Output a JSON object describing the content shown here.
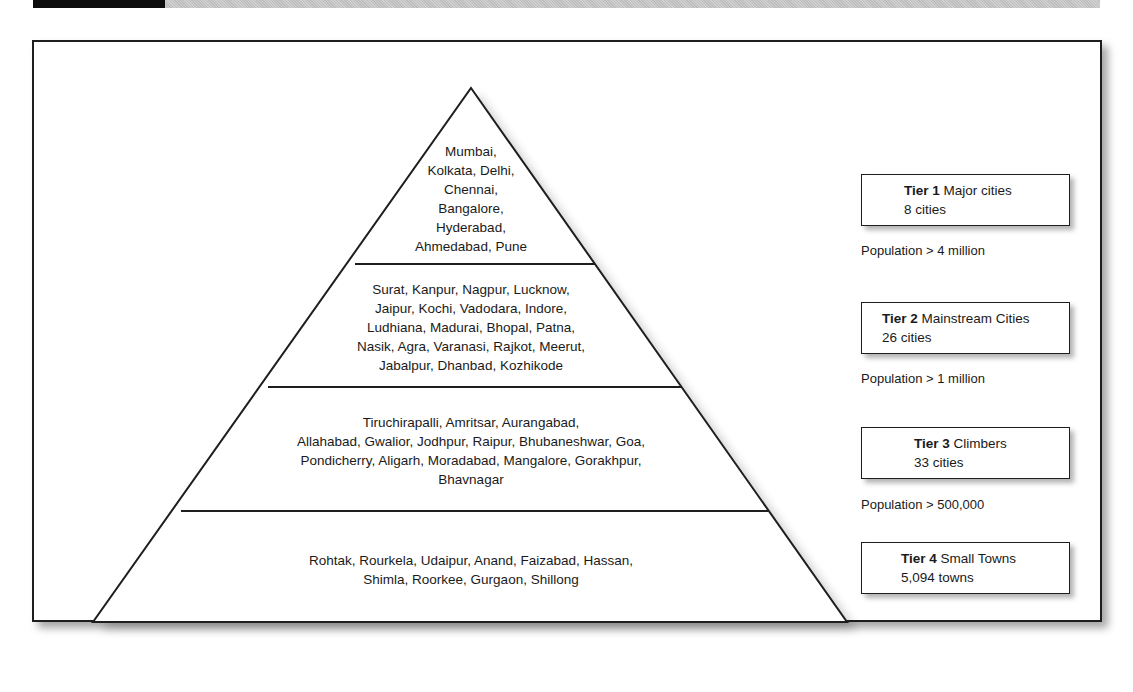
{
  "colors": {
    "line": "#1e1e1e",
    "text": "#1a1a1a",
    "header_block": "#0d0d0d",
    "header_band": "#c6c6c6"
  },
  "pyramid": {
    "levels": [
      {
        "tier": 1,
        "cities_lines": [
          "Mumbai,",
          "Kolkata, Delhi,",
          "Chennai,",
          "Bangalore,",
          "Hyderabad,",
          "Ahmedabad, Pune"
        ]
      },
      {
        "tier": 2,
        "cities_lines": [
          "Surat, Kanpur, Nagpur, Lucknow,",
          "Jaipur, Kochi, Vadodara, Indore,",
          "Ludhiana, Madurai, Bhopal, Patna,",
          "Nasik, Agra, Varanasi, Rajkot, Meerut,",
          "Jabalpur, Dhanbad, Kozhikode"
        ]
      },
      {
        "tier": 3,
        "cities_lines": [
          "Tiruchirapalli, Amritsar, Aurangabad,",
          "Allahabad, Gwalior, Jodhpur, Raipur, Bhubaneshwar, Goa,",
          "Pondicherry, Aligarh, Moradabad, Mangalore, Gorakhpur,",
          "Bhavnagar"
        ]
      },
      {
        "tier": 4,
        "cities_lines": [
          "Rohtak, Rourkela, Udaipur, Anand, Faizabad, Hassan,",
          "Shimla, Roorkee, Gurgaon, Shillong"
        ]
      }
    ]
  },
  "legend": [
    {
      "tier_label": "Tier 1",
      "name": "Major cities",
      "count": "8 cities",
      "population": "Population > 4 million"
    },
    {
      "tier_label": "Tier 2",
      "name": "Mainstream Cities",
      "count": "26 cities",
      "population": "Population > 1 million"
    },
    {
      "tier_label": "Tier 3",
      "name": "Climbers",
      "count": "33 cities",
      "population": "Population > 500,000"
    },
    {
      "tier_label": "Tier 4",
      "name": "Small Towns",
      "count": "5,094 towns",
      "population": ""
    }
  ]
}
